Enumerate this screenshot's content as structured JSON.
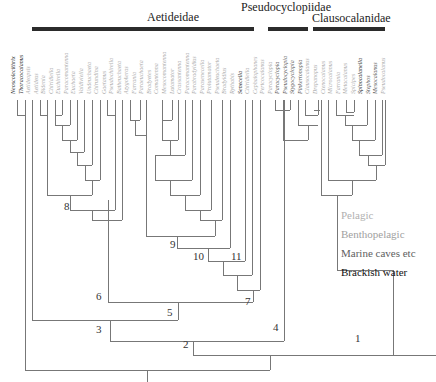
{
  "families": [
    {
      "name": "Aetideidae",
      "x": 147,
      "y": 10,
      "line_x": 32,
      "line_w": 222
    },
    {
      "name": "Pseudocyclopiidae",
      "x": 241,
      "y": 0,
      "line_x": 268,
      "line_w": 40
    },
    {
      "name": "Clausocalanidae",
      "x": 312,
      "y": 11,
      "line_x": 313,
      "line_w": 72
    }
  ],
  "taxa": [
    {
      "name": "Neoscolecithrix",
      "color": "#222222"
    },
    {
      "name": "Thoracocalanus",
      "color": "#222222"
    },
    {
      "name": "Aetideopsis",
      "color": "#aaaaaa"
    },
    {
      "name": "Aetideus",
      "color": "#aaaaaa"
    },
    {
      "name": "Bidenia",
      "color": "#aaaaaa"
    },
    {
      "name": "Chiridiella",
      "color": "#aaaaaa"
    },
    {
      "name": "Euchirella",
      "color": "#aaaaaa"
    },
    {
      "name": "Paracomantenna",
      "color": "#aaaaaa"
    },
    {
      "name": "Euchaeta",
      "color": "#aaaaaa"
    },
    {
      "name": "Valdiviella",
      "color": "#aaaaaa"
    },
    {
      "name": "Undeuchaeta",
      "color": "#aaaaaa"
    },
    {
      "name": "Chirundina",
      "color": "#aaaaaa"
    },
    {
      "name": "Gaetanus",
      "color": "#aaaaaa"
    },
    {
      "name": "Pseudochirella",
      "color": "#aaaaaa"
    },
    {
      "name": "Batheuchaeta",
      "color": "#aaaaaa"
    },
    {
      "name": "Azygokeras",
      "color": "#aaaaaa"
    },
    {
      "name": "Farrania",
      "color": "#aaaaaa"
    },
    {
      "name": "Paraeuchaeta",
      "color": "#aaaaaa"
    },
    {
      "name": "Bradyetes",
      "color": "#aaaaaa"
    },
    {
      "name": "Comantenna",
      "color": "#aaaaaa"
    },
    {
      "name": "Mesocomantenna",
      "color": "#aaaaaa"
    },
    {
      "name": "Lutamator",
      "color": "#aaaaaa"
    },
    {
      "name": "Crassantenna",
      "color": "#aaaaaa"
    },
    {
      "name": "Paracomantenna",
      "color": "#aaaaaa"
    },
    {
      "name": "Parabradyidius",
      "color": "#aaaaaa"
    },
    {
      "name": "Parasenecella",
      "color": "#aaaaaa"
    },
    {
      "name": "Prolutamator",
      "color": "#aaaaaa"
    },
    {
      "name": "Pseudeuchaeta",
      "color": "#aaaaaa"
    },
    {
      "name": "Bradyidius",
      "color": "#aaaaaa"
    },
    {
      "name": "Rythabis",
      "color": "#aaaaaa"
    },
    {
      "name": "Senecella",
      "color": "#222222"
    },
    {
      "name": "Chiridiella",
      "color": "#aaaaaa"
    },
    {
      "name": "Cephalophanes",
      "color": "#aaaaaa"
    },
    {
      "name": "Pertcocalanus",
      "color": "#aaaaaa"
    },
    {
      "name": "Paracyclopia",
      "color": "#aaaaaa"
    },
    {
      "name": "Paracyclopia",
      "color": "#555555"
    },
    {
      "name": "Pseudocyclopia",
      "color": "#555555"
    },
    {
      "name": "Stygocyclopia",
      "color": "#555555"
    },
    {
      "name": "Pinkertonopia",
      "color": "#555555"
    },
    {
      "name": "Clausocalanus",
      "color": "#aaaaaa"
    },
    {
      "name": "Drepanopus",
      "color": "#aaaaaa"
    },
    {
      "name": "Ctenocalanus",
      "color": "#aaaaaa"
    },
    {
      "name": "Microcalanus",
      "color": "#aaaaaa"
    },
    {
      "name": "Farrania",
      "color": "#aaaaaa"
    },
    {
      "name": "Metacalanus",
      "color": "#aaaaaa"
    },
    {
      "name": "Spicipes",
      "color": "#aaaaaa"
    },
    {
      "name": "Spinocalanella",
      "color": "#222222"
    },
    {
      "name": "Stephos",
      "color": "#555555"
    },
    {
      "name": "Mesocalanus",
      "color": "#555555"
    },
    {
      "name": "Pseudocalanus",
      "color": "#aaaaaa"
    }
  ],
  "nodes": [
    {
      "label": "1",
      "x": 355,
      "y": 332
    },
    {
      "label": "2",
      "x": 183,
      "y": 338
    },
    {
      "label": "3",
      "x": 96,
      "y": 323
    },
    {
      "label": "4",
      "x": 273,
      "y": 321
    },
    {
      "label": "5",
      "x": 167,
      "y": 306
    },
    {
      "label": "6",
      "x": 96,
      "y": 290
    },
    {
      "label": "7",
      "x": 245,
      "y": 295
    },
    {
      "label": "8",
      "x": 64,
      "y": 200
    },
    {
      "label": "9",
      "x": 170,
      "y": 238
    },
    {
      "label": "10",
      "x": 193,
      "y": 250
    },
    {
      "label": "11",
      "x": 231,
      "y": 250
    }
  ],
  "legend": [
    {
      "label": "Pelagic",
      "color": "#b0b0b0"
    },
    {
      "label": "Benthopelagic",
      "color": "#a0a0a0"
    },
    {
      "label": "Marine caves etc",
      "color": "#606060"
    },
    {
      "label": "Brackish water",
      "color": "#111111"
    }
  ]
}
